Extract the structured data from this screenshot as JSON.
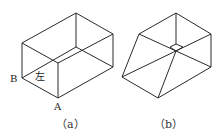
{
  "figures": [
    {
      "caption": "（a）",
      "description": "rectangular box (cuboid) in isometric view",
      "vertex_labels": {
        "A": "A",
        "B": "B"
      },
      "face_label": "左"
    },
    {
      "caption": "（b）",
      "description": "box with one face slanted (truncated/frustum-like solid) in isometric view"
    }
  ],
  "colors": {
    "line": "#2a2a2a",
    "background": "#ffffff"
  }
}
